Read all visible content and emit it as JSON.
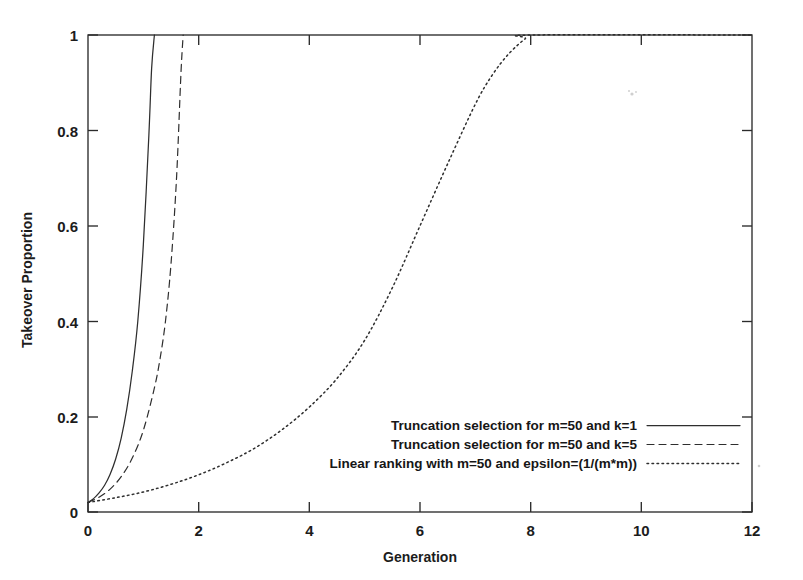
{
  "figure": {
    "background_color": "#ffffff",
    "ink_color": "#2e2e2e"
  },
  "axes": {
    "x_title": "Generation",
    "y_title": "Takeover Proportion",
    "x_ticks": [
      "0",
      "2",
      "4",
      "6",
      "8",
      "10",
      "12"
    ],
    "y_ticks": [
      "0",
      "0.2",
      "0.4",
      "0.6",
      "0.8",
      "1"
    ]
  },
  "legend": {
    "entries": [
      {
        "label": "Truncation selection for m=50 and k=1",
        "style": "solid"
      },
      {
        "label": "Truncation selection for m=50 and k=5",
        "style": "dashed"
      },
      {
        "label": "Linear ranking with m=50 and epsilon=(1/(m*m))",
        "style": "dotted"
      }
    ]
  },
  "chart_data": {
    "type": "line",
    "title": "",
    "xlabel": "Generation",
    "ylabel": "Takeover Proportion",
    "xlim": [
      0,
      12
    ],
    "ylim": [
      0,
      1
    ],
    "xticks": [
      0,
      2,
      4,
      6,
      8,
      10,
      12
    ],
    "yticks": [
      0,
      0.2,
      0.4,
      0.6,
      0.8,
      1
    ],
    "grid": false,
    "legend_position": "inside-lower-right",
    "series": [
      {
        "name": "Truncation selection for m=50 and k=1",
        "style": "solid",
        "x": [
          0,
          0.1,
          0.2,
          0.3,
          0.4,
          0.5,
          0.6,
          0.7,
          0.8,
          0.9,
          1.0,
          1.1,
          1.15,
          1.2
        ],
        "y": [
          0.02,
          0.028,
          0.04,
          0.056,
          0.079,
          0.111,
          0.155,
          0.215,
          0.295,
          0.4,
          0.56,
          0.79,
          0.93,
          1.0
        ]
      },
      {
        "name": "Truncation selection for m=50 and k=5",
        "style": "dashed",
        "x": [
          0,
          0.2,
          0.4,
          0.6,
          0.8,
          1.0,
          1.2,
          1.3,
          1.4,
          1.5,
          1.6,
          1.68,
          1.72
        ],
        "y": [
          0.02,
          0.031,
          0.048,
          0.074,
          0.113,
          0.171,
          0.26,
          0.32,
          0.4,
          0.52,
          0.7,
          0.92,
          1.0
        ]
      },
      {
        "name": "Linear ranking with m=50 and epsilon=(1/(m*m))",
        "style": "dotted",
        "x": [
          0,
          0.5,
          1.0,
          1.5,
          2.0,
          2.5,
          3.0,
          3.5,
          4.0,
          4.5,
          5.0,
          5.5,
          6.0,
          6.5,
          7.0,
          7.3,
          7.6,
          7.9,
          8.05,
          12.0
        ],
        "y": [
          0.02,
          0.03,
          0.042,
          0.058,
          0.078,
          0.103,
          0.133,
          0.172,
          0.22,
          0.28,
          0.36,
          0.47,
          0.6,
          0.73,
          0.855,
          0.915,
          0.96,
          0.992,
          1.0,
          1.0
        ]
      }
    ]
  }
}
